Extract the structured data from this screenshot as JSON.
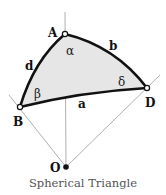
{
  "diagram": {
    "caption": "Spherical Triangle",
    "vertices": {
      "A": {
        "label": "A",
        "angle": "α"
      },
      "B": {
        "label": "B",
        "angle": "β"
      },
      "D": {
        "label": "D",
        "angle": "δ"
      },
      "O": {
        "label": "O"
      }
    },
    "sides": {
      "a": "a",
      "b": "b",
      "d": "d"
    },
    "colors": {
      "fill": "#e6e6e6",
      "edge": "#111111",
      "ray": "#9a9a9a"
    }
  }
}
